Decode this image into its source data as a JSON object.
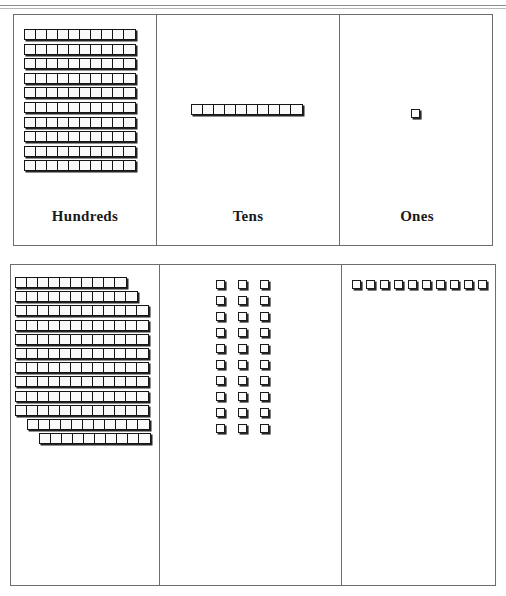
{
  "worksheet": {
    "type": "place-value-chart",
    "unit_block_label": "unit-cube",
    "rod_label": "ten-rod",
    "flat_label": "hundred-flat"
  },
  "top_chart": {
    "columns": [
      {
        "key": "hundreds",
        "label": "Hundreds",
        "representation": "flat",
        "rods": 10,
        "units_per_rod": 10,
        "value": 100
      },
      {
        "key": "tens",
        "label": "Tens",
        "representation": "rod",
        "rods": 1,
        "units_per_rod": 10,
        "value": 10
      },
      {
        "key": "ones",
        "label": "Ones",
        "representation": "cube",
        "cubes": 1,
        "value": 1
      }
    ]
  },
  "bottom_chart": {
    "columns": [
      {
        "key": "hundreds",
        "label": "Hundreds",
        "representation": "fanned-rod-stack",
        "rods": 12,
        "units_per_rod": 10,
        "row_unit_counts": [
          10,
          11,
          12,
          12,
          12,
          12,
          12,
          12,
          12,
          12,
          11,
          10
        ],
        "row_indent_px": [
          0,
          0,
          0,
          0,
          0,
          0,
          0,
          0,
          0,
          0,
          12,
          24
        ],
        "value": 120
      },
      {
        "key": "tens",
        "label": "Tens",
        "representation": "cube-grid",
        "grid_columns": 3,
        "grid_rows": 10,
        "cubes": 30,
        "value": 30
      },
      {
        "key": "ones",
        "label": "Ones",
        "representation": "cube-row",
        "cubes": 10,
        "value": 10
      }
    ]
  },
  "colors": {
    "block_outline": "#151515",
    "block_fill": "#fafafa",
    "block_shadow": "#232323",
    "table_border": "#6d6d6d",
    "page_background": "#ffffff",
    "text": "#1a1a1a"
  }
}
